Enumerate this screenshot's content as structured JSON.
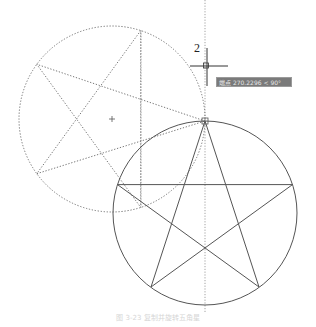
{
  "diagram": {
    "type": "cad-drawing",
    "colors": {
      "stroke": "#555555",
      "dotted": "#777777",
      "tooltip_bg": "#7a7a7a",
      "tooltip_text": "#e8e8e8",
      "background": "#ffffff"
    },
    "solid_circle": {
      "cx": 205,
      "cy": 213,
      "r": 92
    },
    "solid_star": {
      "points": [
        [
          205,
          121
        ],
        [
          259,
          287
        ],
        [
          117.5,
          184.6
        ],
        [
          292.5,
          184.6
        ],
        [
          151,
          287
        ]
      ]
    },
    "dotted_circle": {
      "cx": 112,
      "cy": 119,
      "r": 93
    },
    "dotted_star": {
      "points": [
        [
          205,
          121
        ],
        [
          36.8,
          64.3
        ],
        [
          140.7,
          207.4
        ],
        [
          140.7,
          30.6
        ],
        [
          36.8,
          173.7
        ]
      ]
    },
    "dotted_center_mark": {
      "x": 112,
      "y": 119
    },
    "vertical_guides": [
      {
        "x": 205,
        "y1": 0,
        "y2": 312
      },
      {
        "x": 141,
        "y1": 30,
        "y2": 208
      }
    ],
    "cursor": {
      "x": 207,
      "y": 66
    },
    "dimension_label": "2",
    "tooltip_text": "端点  270.2296 < 90°",
    "caption": "图 3-23  复制并旋转五角星"
  }
}
